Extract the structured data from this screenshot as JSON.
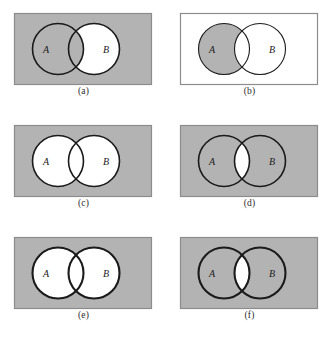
{
  "figure": {
    "background_color": "#ffffff",
    "shade_color": "#b3b3b3",
    "white_color": "#ffffff",
    "outline_color": "#1a1a1a",
    "border_color": "#8c8c8c",
    "label_color": "#1a1a1a",
    "caption_color": "#2b2b2b"
  },
  "panels": [
    {
      "id": "a",
      "caption": "(a)",
      "label_a": "A",
      "label_b": "B",
      "universe_fill": "#b3b3b3",
      "a_only_fill": "#b3b3b3",
      "b_only_fill": "#ffffff",
      "intersection_fill": "#b3b3b3",
      "outline_width": 1.6,
      "border_visible": true,
      "description": "Complement of B minus A shaded; only the B-only crescent is white"
    },
    {
      "id": "b",
      "caption": "(b)",
      "label_a": "A",
      "label_b": "B",
      "universe_fill": "#ffffff",
      "a_only_fill": "#b3b3b3",
      "b_only_fill": "#ffffff",
      "intersection_fill": "#ffffff",
      "outline_width": 1.1,
      "border_visible": true,
      "description": "White universe with only the A-only crescent shaded"
    },
    {
      "id": "c",
      "caption": "(c)",
      "label_a": "A",
      "label_b": "B",
      "universe_fill": "#b3b3b3",
      "a_only_fill": "#ffffff",
      "b_only_fill": "#ffffff",
      "intersection_fill": "#ffffff",
      "outline_width": 1.6,
      "border_visible": true,
      "description": "Complement of A union B shaded; both circles white"
    },
    {
      "id": "d",
      "caption": "(d)",
      "label_a": "A",
      "label_b": "B",
      "universe_fill": "#b3b3b3",
      "a_only_fill": "#b3b3b3",
      "b_only_fill": "#b3b3b3",
      "intersection_fill": "#ffffff",
      "outline_width": 1.6,
      "border_visible": true,
      "description": "Everything shaded except the intersection lens"
    },
    {
      "id": "e",
      "caption": "(e)",
      "label_a": "A",
      "label_b": "B",
      "universe_fill": "#b3b3b3",
      "a_only_fill": "#ffffff",
      "b_only_fill": "#ffffff",
      "intersection_fill": "#ffffff",
      "outline_width": 2.1,
      "border_visible": true,
      "description": "Complement of A union B shaded; both circles white, heavier outlines"
    },
    {
      "id": "f",
      "caption": "(f)",
      "label_a": "A",
      "label_b": "B",
      "universe_fill": "#b3b3b3",
      "a_only_fill": "#b3b3b3",
      "b_only_fill": "#b3b3b3",
      "intersection_fill": "#ffffff",
      "outline_width": 2.1,
      "border_visible": true,
      "description": "Everything shaded except the intersection lens, heavier outlines"
    }
  ]
}
